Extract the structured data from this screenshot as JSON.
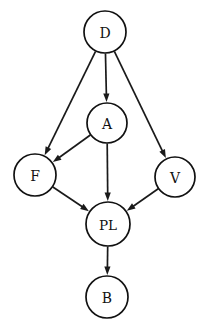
{
  "figure": {
    "kind": "directed-acyclic-graph",
    "background_color": "#ffffff",
    "stroke_color": "#111111",
    "text_color": "#111111",
    "width": 211,
    "height": 334
  },
  "graph_data": {
    "type": "diagram",
    "directed": true,
    "nodes": [
      {
        "id": "D",
        "label": "D",
        "cx": 105,
        "cy": 32,
        "r": 21
      },
      {
        "id": "A",
        "label": "A",
        "cx": 107,
        "cy": 123,
        "r": 20
      },
      {
        "id": "F",
        "label": "F",
        "cx": 35,
        "cy": 175,
        "r": 21
      },
      {
        "id": "V",
        "label": "V",
        "cx": 175,
        "cy": 177,
        "r": 20
      },
      {
        "id": "PL",
        "label": "PL",
        "cx": 108,
        "cy": 224,
        "r": 22
      },
      {
        "id": "B",
        "label": "B",
        "cx": 107,
        "cy": 297,
        "r": 21
      }
    ],
    "edges": [
      {
        "from": "D",
        "to": "F"
      },
      {
        "from": "D",
        "to": "A"
      },
      {
        "from": "D",
        "to": "V"
      },
      {
        "from": "A",
        "to": "F"
      },
      {
        "from": "A",
        "to": "PL"
      },
      {
        "from": "F",
        "to": "PL"
      },
      {
        "from": "V",
        "to": "PL"
      },
      {
        "from": "PL",
        "to": "B"
      }
    ]
  }
}
